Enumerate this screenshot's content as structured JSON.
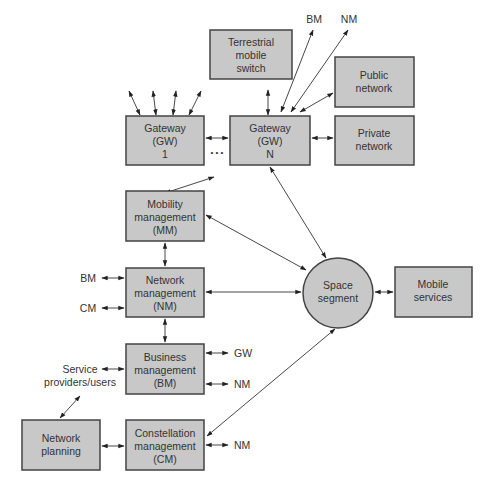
{
  "diagram": {
    "colors": {
      "box_fill": "#c8c8c8",
      "box_stroke": "#444444",
      "line": "#333333",
      "text": "#333333"
    },
    "nodes": {
      "terrestrial": {
        "lines": [
          "Terrestrial",
          "mobile",
          "switch"
        ]
      },
      "gateway1": {
        "lines": [
          "Gateway",
          "(GW)",
          "1"
        ]
      },
      "gatewayN": {
        "lines": [
          "Gateway",
          "(GW)",
          "N"
        ]
      },
      "public": {
        "lines": [
          "Public",
          "network"
        ]
      },
      "private": {
        "lines": [
          "Private",
          "network"
        ]
      },
      "mm": {
        "lines": [
          "Mobility",
          "management",
          "(MM)"
        ]
      },
      "nm": {
        "lines": [
          "Network",
          "management",
          "(NM)"
        ]
      },
      "bm": {
        "lines": [
          "Business",
          "management",
          "(BM)"
        ]
      },
      "cm": {
        "lines": [
          "Constellation",
          "management",
          "(CM)"
        ]
      },
      "planning": {
        "lines": [
          "Network",
          "planning"
        ]
      },
      "space": {
        "lines": [
          "Space",
          "segment"
        ]
      },
      "mobile": {
        "lines": [
          "Mobile",
          "services"
        ]
      }
    },
    "ellipsis": "• • •",
    "labels": {
      "top_bm": "BM",
      "top_nm": "NM",
      "nm_left_bm": "BM",
      "nm_left_cm": "CM",
      "bm_right_gw": "GW",
      "bm_right_nm": "NM",
      "cm_right_nm": "NM",
      "service_providers": [
        "Service",
        "providers/users"
      ]
    }
  }
}
